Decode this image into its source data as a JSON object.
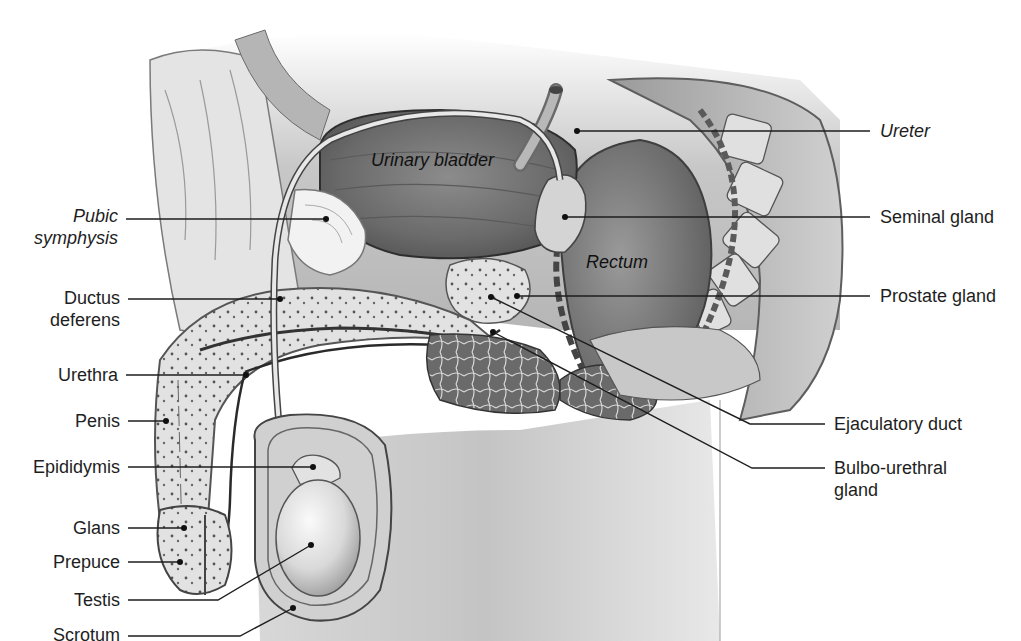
{
  "figure": {
    "palette": {
      "background": "#ffffff",
      "tissue_light": "#e9e9e9",
      "tissue_mid": "#bdbdbd",
      "tissue_dark": "#6e6e6e",
      "bladder": "#7d7d7d",
      "rectum": "#8a8a8a",
      "leader_line": "#1e1e1e",
      "label_text": "#1e1e1e"
    }
  },
  "inner_labels": {
    "urinary_bladder": "Urinary bladder",
    "rectum": "Rectum"
  },
  "left_labels": [
    {
      "id": "pubic-symphysis",
      "line1": "Pubic",
      "line2": "symphysis",
      "italic": true
    },
    {
      "id": "ductus-deferens",
      "line1": "Ductus",
      "line2": "deferens",
      "italic": false
    },
    {
      "id": "urethra",
      "line1": "Urethra",
      "italic": false
    },
    {
      "id": "penis",
      "line1": "Penis",
      "italic": false
    },
    {
      "id": "epididymis",
      "line1": "Epididymis",
      "italic": false
    },
    {
      "id": "glans",
      "line1": "Glans",
      "italic": false
    },
    {
      "id": "prepuce",
      "line1": "Prepuce",
      "italic": false
    },
    {
      "id": "testis",
      "line1": "Testis",
      "italic": false
    },
    {
      "id": "scrotum",
      "line1": "Scrotum",
      "italic": false
    }
  ],
  "right_labels": [
    {
      "id": "ureter",
      "line1": "Ureter",
      "italic": true
    },
    {
      "id": "seminal-gland",
      "line1": "Seminal gland",
      "italic": false
    },
    {
      "id": "prostate-gland",
      "line1": "Prostate gland",
      "italic": false
    },
    {
      "id": "ejaculatory-duct",
      "line1": "Ejaculatory duct",
      "italic": false
    },
    {
      "id": "bulbo-urethral-gland",
      "line1": "Bulbo-urethral",
      "line2": "gland",
      "italic": false
    }
  ]
}
